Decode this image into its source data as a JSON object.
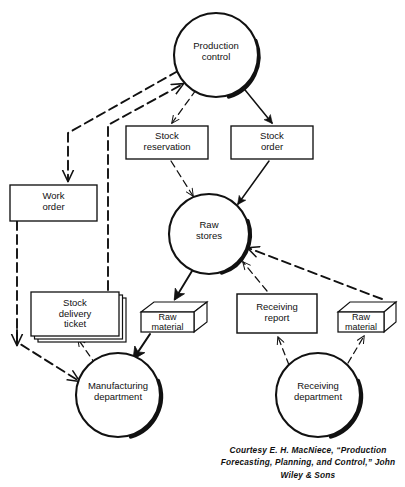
{
  "figure": {
    "type": "flowchart",
    "caption": "Courtesy E. H. MacNiece, “Production Forecasting, Planning, and Control,” John Wiley & Sons",
    "colors": {
      "stroke": "#111111",
      "fill": "#ffffff",
      "shadow": "#111111",
      "text": "#111111",
      "background": "#ffffff"
    }
  },
  "nodes": [
    {
      "id": "production-control",
      "shape": "circle",
      "label": "Production\ncontrol",
      "cx": 216,
      "cy": 55,
      "r": 42
    },
    {
      "id": "stock-reservation",
      "shape": "rect",
      "label": "Stock\nreservation",
      "x": 126,
      "y": 126,
      "w": 82,
      "h": 33
    },
    {
      "id": "stock-order",
      "shape": "rect",
      "label": "Stock\norder",
      "x": 231,
      "y": 126,
      "w": 82,
      "h": 33
    },
    {
      "id": "work-order",
      "shape": "rect",
      "label": "Work\norder",
      "x": 10,
      "y": 185,
      "w": 87,
      "h": 36
    },
    {
      "id": "raw-stores",
      "shape": "circle",
      "label": "Raw\nstores",
      "cx": 209,
      "cy": 234,
      "r": 40
    },
    {
      "id": "stock-delivery-ticket",
      "shape": "stacked-rect",
      "label": "Stock\ndelivery\nticket",
      "x": 31,
      "y": 292,
      "w": 88,
      "h": 44
    },
    {
      "id": "raw-material-left",
      "shape": "box3d",
      "label": "Raw\nmaterial",
      "x": 141,
      "y": 302,
      "w": 66,
      "h": 30
    },
    {
      "id": "receiving-report",
      "shape": "rect",
      "label": "Receiving\nreport",
      "x": 237,
      "y": 294,
      "w": 80,
      "h": 39
    },
    {
      "id": "raw-material-right",
      "shape": "box3d",
      "label": "Raw\nmaterial",
      "x": 338,
      "y": 302,
      "w": 58,
      "h": 30
    },
    {
      "id": "manufacturing-department",
      "shape": "circle",
      "label": "Manufacturing\ndepartment",
      "cx": 118,
      "cy": 395,
      "r": 42
    },
    {
      "id": "receiving-department",
      "shape": "circle",
      "label": "Receiving\ndepartment",
      "cx": 318,
      "cy": 395,
      "r": 42
    }
  ],
  "edges": [
    {
      "id": "pc-to-stock-reservation",
      "from": "production-control",
      "to": "stock-reservation",
      "style": "dashed",
      "flow": "document"
    },
    {
      "id": "pc-to-stock-order",
      "from": "production-control",
      "to": "stock-order",
      "style": "solid",
      "flow": "document"
    },
    {
      "id": "pc-to-work-order",
      "from": "production-control",
      "to": "work-order",
      "style": "dashed",
      "flow": "document"
    },
    {
      "id": "sdt-to-pc",
      "from": "stock-delivery-ticket",
      "to": "production-control",
      "style": "dashed",
      "flow": "document"
    },
    {
      "id": "sr-to-raw-stores",
      "from": "stock-reservation",
      "to": "raw-stores",
      "style": "dashed",
      "flow": "document"
    },
    {
      "id": "so-to-raw-stores",
      "from": "stock-order",
      "to": "raw-stores",
      "style": "solid",
      "flow": "document"
    },
    {
      "id": "raw-stores-to-material",
      "from": "raw-stores",
      "to": "raw-material-left",
      "style": "solid",
      "flow": "material"
    },
    {
      "id": "material-to-manufacturing",
      "from": "raw-material-left",
      "to": "manufacturing-department",
      "style": "solid",
      "flow": "material"
    },
    {
      "id": "wo-to-manufacturing",
      "from": "work-order",
      "to": "manufacturing-department",
      "style": "dashed",
      "flow": "document"
    },
    {
      "id": "manufacturing-to-sdt",
      "from": "manufacturing-department",
      "to": "stock-delivery-ticket",
      "style": "dashed",
      "flow": "document"
    },
    {
      "id": "receiving-to-report",
      "from": "receiving-department",
      "to": "receiving-report",
      "style": "dashed",
      "flow": "document"
    },
    {
      "id": "receiving-to-material",
      "from": "receiving-department",
      "to": "raw-material-right",
      "style": "dashed",
      "flow": "material"
    },
    {
      "id": "report-to-raw-stores",
      "from": "receiving-report",
      "to": "raw-stores",
      "style": "dashed",
      "flow": "document"
    },
    {
      "id": "rawmaterial-to-raw-stores",
      "from": "raw-material-right",
      "to": "raw-stores",
      "style": "dashed",
      "flow": "material"
    }
  ],
  "legend": {
    "solid": "material / primary flow",
    "dashed": "document flow"
  }
}
